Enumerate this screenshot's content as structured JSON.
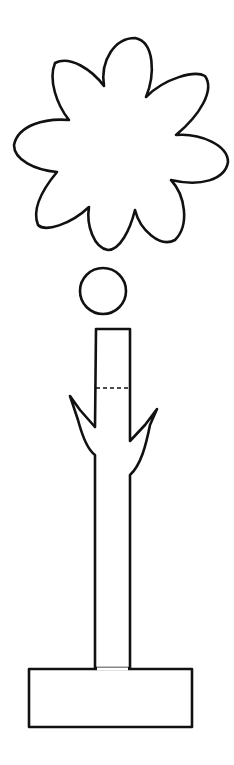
{
  "drawing": {
    "title": "Flower craft template",
    "parts": [
      {
        "name": "flower-petals",
        "shape": "eight-petal flower outline"
      },
      {
        "name": "flower-center",
        "shape": "circle"
      },
      {
        "name": "stem-with-leaves",
        "shape": "stem with fold line and two leaves"
      },
      {
        "name": "base",
        "shape": "rectangle"
      }
    ],
    "colors": {
      "line": "#111111",
      "background": "#ffffff"
    }
  }
}
